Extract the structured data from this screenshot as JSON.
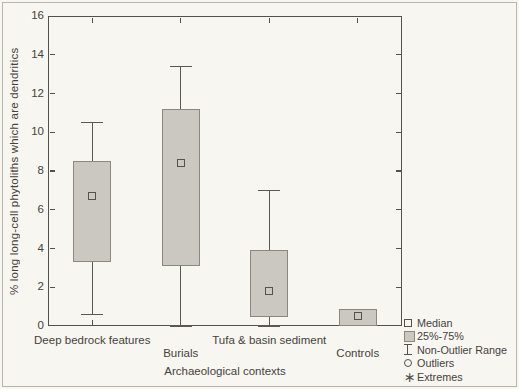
{
  "chart_data": {
    "type": "boxplot",
    "title": "",
    "xlabel": "Archaeological contexts",
    "ylabel": "% long long-cell phytoliths which are dendritics",
    "ylim": [
      0,
      16
    ],
    "yticks": [
      0,
      2,
      4,
      6,
      8,
      10,
      12,
      14,
      16
    ],
    "grid": false,
    "legend_position": "outside-bottom-right",
    "categories": [
      "Deep bedrock features",
      "Burials",
      "Tufa & basin sediment",
      "Controls"
    ],
    "series": [
      {
        "category": "Deep bedrock features",
        "whisker_low": 0.6,
        "q1": 3.3,
        "median": 6.7,
        "q3": 8.5,
        "whisker_high": 10.5
      },
      {
        "category": "Burials",
        "whisker_low": 0.0,
        "q1": 3.1,
        "median": 8.4,
        "q3": 11.2,
        "whisker_high": 13.4
      },
      {
        "category": "Tufa & basin sediment",
        "whisker_low": 0.0,
        "q1": 0.45,
        "median": 1.8,
        "q3": 3.9,
        "whisker_high": 7.0
      },
      {
        "category": "Controls",
        "whisker_low": null,
        "q1": 0.0,
        "median": 0.5,
        "q3": 0.9,
        "whisker_high": null
      }
    ],
    "legend": [
      {
        "icon": "median-marker-icon",
        "label": "Median"
      },
      {
        "icon": "iqr-box-icon",
        "label": "25%-75%"
      },
      {
        "icon": "non-outlier-range-icon",
        "label": "Non-Outlier Range"
      },
      {
        "icon": "outlier-circle-icon",
        "label": "Outliers"
      },
      {
        "icon": "extreme-asterisk-icon",
        "label": "Extremes"
      }
    ],
    "colors": {
      "background": "#f8f6f1",
      "box_fill": "#cbc8c1",
      "box_border": "#8b877e",
      "line": "#55524b",
      "text": "#45423c"
    }
  }
}
